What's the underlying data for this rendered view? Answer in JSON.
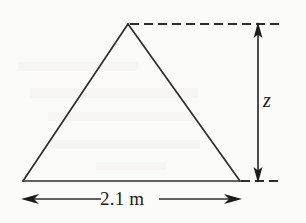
{
  "figure": {
    "kind": "geometry-diagram",
    "shape": "isosceles-triangle",
    "background_color": "#fbfbfa",
    "stroke_color": "#2e2e2e",
    "text_color": "#1c1c1c",
    "labels": {
      "height_label": "z",
      "base_label": "2.1 m"
    },
    "dimensions": {
      "base_measure": "2.1 m",
      "base_value": 2.1,
      "base_unit": "m",
      "height_symbol": "z"
    },
    "geometry": {
      "apex": {
        "x": 128,
        "y": 24
      },
      "bottom_left": {
        "x": 23,
        "y": 181
      },
      "bottom_right": {
        "x": 240,
        "y": 181
      }
    },
    "annotations": [
      {
        "name": "top-extension-line",
        "style": "dashed",
        "orientation": "horizontal",
        "from_x": 128,
        "to_x": 283,
        "y": 24
      },
      {
        "name": "bottom-extension-line",
        "style": "dashed",
        "orientation": "horizontal",
        "from_x": 240,
        "to_x": 283,
        "y": 181
      },
      {
        "name": "height-dimension-arrow",
        "style": "double-headed",
        "orientation": "vertical",
        "x": 258,
        "from_y": 24,
        "to_y": 181,
        "label": "z"
      },
      {
        "name": "base-dimension-arrow",
        "style": "double-headed",
        "orientation": "horizontal",
        "y": 199,
        "from_x": 23,
        "to_x": 240,
        "label": "2.1 m"
      }
    ]
  }
}
